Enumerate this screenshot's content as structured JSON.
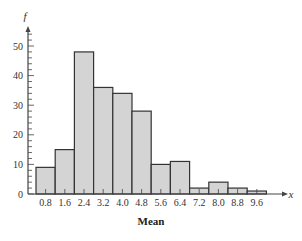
{
  "chart_data": {
    "type": "bar",
    "title": "",
    "xlabel": "Mean",
    "ylabel": "f",
    "x_axis_symbol": "x",
    "bin_width": 0.8,
    "bin_edges": [
      0.4,
      1.2,
      2.0,
      2.8,
      3.6,
      4.4,
      5.2,
      6.0,
      6.8,
      7.6,
      8.4,
      9.2,
      10.0
    ],
    "categories": [
      "0.8",
      "1.6",
      "2.4",
      "3.2",
      "4.0",
      "4.8",
      "5.6",
      "6.4",
      "7.2",
      "8.0",
      "8.8",
      "9.6"
    ],
    "values": [
      9,
      15,
      48,
      36,
      34,
      28,
      10,
      11,
      2,
      4,
      2,
      1
    ],
    "y_ticks": [
      "0",
      "10",
      "20",
      "30",
      "40",
      "50"
    ],
    "ylim": [
      0,
      55
    ],
    "grid": false,
    "legend": null,
    "colors": {
      "bar_fill": "#d4d4d4",
      "bar_edge": "#333333",
      "axis": "#444444"
    }
  }
}
